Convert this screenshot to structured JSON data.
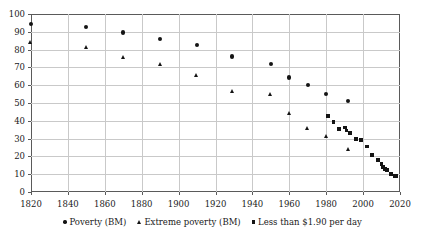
{
  "chart_data": {
    "type": "scatter",
    "title": "",
    "subtitle": "",
    "xlabel": "",
    "ylabel": "",
    "xlim": [
      1820,
      2020
    ],
    "ylim": [
      0,
      100
    ],
    "xticks": [
      1820,
      1840,
      1860,
      1880,
      1900,
      1920,
      1940,
      1960,
      1980,
      2000,
      2020
    ],
    "yticks": [
      0,
      10,
      20,
      30,
      40,
      50,
      60,
      70,
      80,
      90,
      100
    ],
    "grid": true,
    "legend_position": "bottom",
    "series": [
      {
        "name": "Poverty (BM)",
        "marker": "circle",
        "color": "#141414",
        "points": [
          {
            "x": 1820,
            "y": 94.4
          },
          {
            "x": 1850,
            "y": 92.6
          },
          {
            "x": 1870,
            "y": 89.6
          },
          {
            "x": 1890,
            "y": 85.9
          },
          {
            "x": 1910,
            "y": 82.4
          },
          {
            "x": 1929,
            "y": 76.1
          },
          {
            "x": 1950,
            "y": 72.0
          },
          {
            "x": 1960,
            "y": 64.3
          },
          {
            "x": 1970,
            "y": 60.1
          },
          {
            "x": 1980,
            "y": 55.2
          },
          {
            "x": 1992,
            "y": 51.3
          }
        ]
      },
      {
        "name": "Extreme poverty (BM)",
        "marker": "triangle",
        "color": "#141414",
        "points": [
          {
            "x": 1820,
            "y": 83.9
          },
          {
            "x": 1850,
            "y": 81.3
          },
          {
            "x": 1870,
            "y": 75.4
          },
          {
            "x": 1890,
            "y": 71.6
          },
          {
            "x": 1910,
            "y": 65.6
          },
          {
            "x": 1929,
            "y": 56.3
          },
          {
            "x": 1950,
            "y": 54.8
          },
          {
            "x": 1960,
            "y": 44.0
          },
          {
            "x": 1970,
            "y": 35.7
          },
          {
            "x": 1980,
            "y": 31.4
          },
          {
            "x": 1992,
            "y": 23.7
          }
        ]
      },
      {
        "name": "Less than $1.90 per day",
        "marker": "square",
        "color": "#141414",
        "points": [
          {
            "x": 1981,
            "y": 42.7
          },
          {
            "x": 1984,
            "y": 39.5
          },
          {
            "x": 1987,
            "y": 35.6
          },
          {
            "x": 1990,
            "y": 36.2
          },
          {
            "x": 1991,
            "y": 34.5
          },
          {
            "x": 1993,
            "y": 33.0
          },
          {
            "x": 1996,
            "y": 29.8
          },
          {
            "x": 1999,
            "y": 29.0
          },
          {
            "x": 2002,
            "y": 25.6
          },
          {
            "x": 2005,
            "y": 21.0
          },
          {
            "x": 2008,
            "y": 18.1
          },
          {
            "x": 2010,
            "y": 15.7
          },
          {
            "x": 2011,
            "y": 14.0
          },
          {
            "x": 2012,
            "y": 12.8
          },
          {
            "x": 2013,
            "y": 12.4
          },
          {
            "x": 2015,
            "y": 10.0
          },
          {
            "x": 2017,
            "y": 9.2
          },
          {
            "x": 2018,
            "y": 9.1
          }
        ]
      }
    ]
  },
  "legend": {
    "items": [
      {
        "label": "Poverty (BM)",
        "marker": "circle"
      },
      {
        "label": "Extreme poverty (BM)",
        "marker": "triangle"
      },
      {
        "label": "Less than $1.90 per day",
        "marker": "square"
      }
    ]
  },
  "colors": {
    "marker": "#141414",
    "grid": "#c9c9c9",
    "axis": "#5a5a5a",
    "background": "#ffffff",
    "text": "#1a1a1a"
  }
}
